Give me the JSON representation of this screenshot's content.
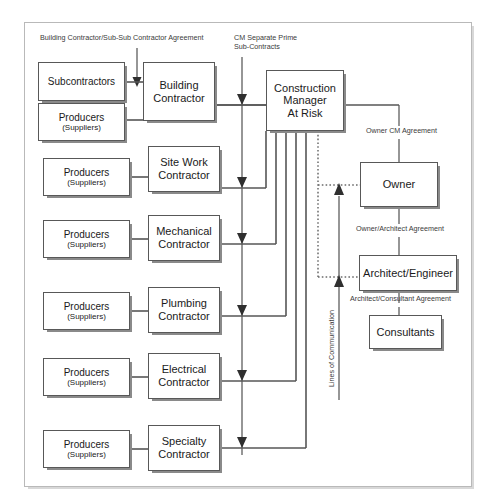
{
  "diagram": {
    "title_labels": {
      "building_sub_agreement": "Building Contractor/Sub-Sub Contractor Agreement",
      "cm_separate_prime": "CM Separate Prime\nSub-Contracts",
      "owner_cm_agreement": "Owner CM Agreement",
      "owner_architect_agreement": "Owner/Architect Agreement",
      "architect_consultant_agreement": "Architect/Consultant Agreement",
      "lines_of_communication": "Lines of Communication"
    },
    "nodes": {
      "subcontractors": {
        "line1": "Subcontractors"
      },
      "producers_1": {
        "line1": "Producers",
        "line2": "(Suppliers)"
      },
      "producers_2": {
        "line1": "Producers",
        "line2": "(Suppliers)"
      },
      "producers_3": {
        "line1": "Producers",
        "line2": "(Suppliers)"
      },
      "producers_4": {
        "line1": "Producers",
        "line2": "(Suppliers)"
      },
      "producers_5": {
        "line1": "Producers",
        "line2": "(Suppliers)"
      },
      "producers_6": {
        "line1": "Producers",
        "line2": "(Suppliers)"
      },
      "building_contractor": {
        "line1": "Building",
        "line2": "Contractor"
      },
      "site_work_contractor": {
        "line1": "Site Work",
        "line2": "Contractor"
      },
      "mechanical_contractor": {
        "line1": "Mechanical",
        "line2": "Contractor"
      },
      "plumbing_contractor": {
        "line1": "Plumbing",
        "line2": "Contractor"
      },
      "electrical_contractor": {
        "line1": "Electrical",
        "line2": "Contractor"
      },
      "specialty_contractor": {
        "line1": "Specialty",
        "line2": "Contractor"
      },
      "construction_manager": {
        "line1": "Construction",
        "line2": "Manager",
        "line3": "At Risk"
      },
      "owner": {
        "line1": "Owner"
      },
      "architect_engineer": {
        "line1": "Architect/Engineer"
      },
      "consultants": {
        "line1": "Consultants"
      }
    },
    "colors": {
      "box_border": "#585858",
      "box_fill": "#ffffff",
      "shadow": "#8a8a8a",
      "frame_border": "#b9b9b9",
      "wire": "#565656",
      "text": "#1a1a1a"
    }
  }
}
